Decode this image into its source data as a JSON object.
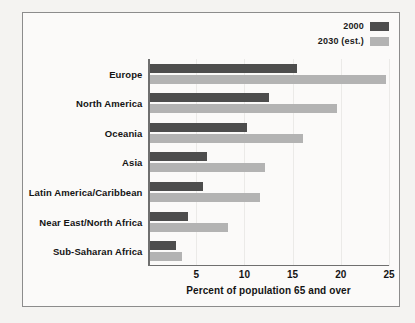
{
  "chart_data": {
    "type": "bar",
    "orientation": "horizontal",
    "title": "",
    "xlabel": "Percent of population 65 and over",
    "ylabel": "",
    "xlim": [
      0,
      25
    ],
    "xticks": [
      5,
      10,
      15,
      20,
      25
    ],
    "grid": true,
    "legend_position": "top-right",
    "categories": [
      "Europe",
      "North America",
      "Oceania",
      "Asia",
      "Latin America/Caribbean",
      "Near East/North Africa",
      "Sub-Saharan Africa"
    ],
    "series": [
      {
        "name": "2000",
        "color": "#4d4d4d",
        "values": [
          15.3,
          12.4,
          10.1,
          6.0,
          5.5,
          4.0,
          2.8
        ]
      },
      {
        "name": "2030 (est.)",
        "color": "#b3b3b3",
        "values": [
          24.5,
          19.4,
          15.9,
          12.0,
          11.5,
          8.1,
          3.4
        ]
      }
    ]
  },
  "legend": {
    "items": [
      {
        "label": "2000",
        "color": "#4d4d4d"
      },
      {
        "label": "2030 (est.)",
        "color": "#b3b3b3"
      }
    ]
  }
}
